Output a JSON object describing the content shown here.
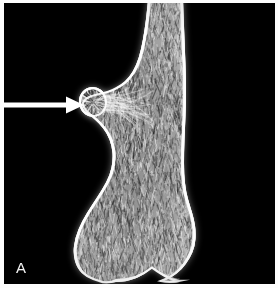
{
  "figure": {
    "panel_label": "A",
    "modality": "radiograph",
    "background_color": "#000000",
    "border_color": "#ffffff"
  },
  "annotations": {
    "arrow": {
      "icon": "arrow-right-icon",
      "color": "#ffffff",
      "tail_x": 0,
      "tail_y": 102,
      "tip_x": 79,
      "tip_y": 102,
      "shaft_thickness": 5,
      "head_length": 16,
      "head_width": 17,
      "points_at": "bony-protuberance"
    }
  },
  "chart_data": {
    "type": "scatter",
    "title": "",
    "xlabel": "",
    "ylabel": "",
    "grid": false,
    "legend": null,
    "bone": {
      "name": "distal femur",
      "cortex_color": "#f5f5f5",
      "marrow_color": "#9a9a9a",
      "outline_right": [
        [
          183,
          0
        ],
        [
          184,
          26
        ],
        [
          185,
          52
        ],
        [
          186,
          78
        ],
        [
          186,
          104
        ],
        [
          185,
          128
        ],
        [
          184,
          152
        ],
        [
          184,
          174
        ],
        [
          186,
          192
        ],
        [
          190,
          206
        ],
        [
          194,
          219
        ],
        [
          196,
          232
        ],
        [
          195,
          246
        ],
        [
          190,
          258
        ],
        [
          182,
          269
        ],
        [
          172,
          277
        ],
        [
          162,
          281
        ]
      ],
      "outline_left": [
        [
          148,
          0
        ],
        [
          146,
          20
        ],
        [
          143,
          40
        ],
        [
          139,
          58
        ],
        [
          133,
          72
        ],
        [
          125,
          82
        ],
        [
          116,
          88
        ],
        [
          107,
          92
        ],
        [
          98,
          94
        ],
        [
          90,
          96
        ],
        [
          84,
          99
        ],
        [
          81,
          104
        ],
        [
          84,
          110
        ],
        [
          91,
          116
        ],
        [
          99,
          123
        ],
        [
          107,
          133
        ],
        [
          112,
          146
        ],
        [
          113,
          160
        ],
        [
          110,
          175
        ],
        [
          102,
          190
        ],
        [
          92,
          205
        ],
        [
          82,
          221
        ],
        [
          75,
          238
        ],
        [
          73,
          254
        ],
        [
          77,
          268
        ],
        [
          86,
          277
        ],
        [
          98,
          281
        ]
      ],
      "notch": {
        "description": "intercondylar notch",
        "apex_x": 152,
        "apex_y": 268,
        "left_condyle_x": 116,
        "right_condyle_x": 186,
        "base_y": 282
      }
    },
    "lesion": {
      "name": "exostosis / osteochondroma",
      "center_x": 93,
      "center_y": 102,
      "radius_x": 14,
      "radius_y": 15,
      "cortex_rim_color": "#fbfbfb",
      "trabecular_color": "#8f8f8f"
    }
  }
}
